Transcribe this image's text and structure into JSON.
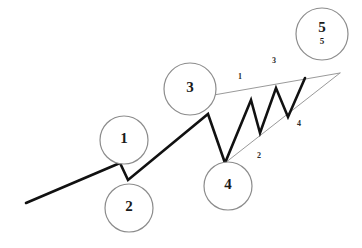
{
  "diagram": {
    "background_color": "#ffffff",
    "wave_line_color": "#111111",
    "trendline_color": "#9a9a9a",
    "circle_stroke_color": "#8c8c8c",
    "label_color": "#1a1a1a"
  },
  "wave_path": {
    "name": "main-impulse-path",
    "points": "26,203 120,163 128,180 208,114 225,163 251,100 260,133 276,88 288,117 305,78",
    "stroke_width": 2.6
  },
  "trendlines": [
    {
      "name": "upper-trendline",
      "points": "208,96 340,73",
      "stroke_width": 1.0
    },
    {
      "name": "lower-trendline",
      "points": "225,163 340,73",
      "stroke_width": 1.0
    }
  ],
  "degree_markers": [
    {
      "id": "marker-1",
      "label": "1",
      "sub_label": "",
      "cx": 124,
      "cy": 140,
      "r": 24
    },
    {
      "id": "marker-2",
      "label": "2",
      "sub_label": "",
      "cx": 129,
      "cy": 208,
      "r": 24
    },
    {
      "id": "marker-3",
      "label": "3",
      "sub_label": "",
      "cx": 190,
      "cy": 89,
      "r": 26
    },
    {
      "id": "marker-4",
      "label": "4",
      "sub_label": "",
      "cx": 228,
      "cy": 186,
      "r": 24
    },
    {
      "id": "marker-5",
      "label": "5",
      "sub_label": "5",
      "cx": 322,
      "cy": 34,
      "r": 26
    }
  ],
  "sub_wave_labels": [
    {
      "id": "sub-label-1",
      "text": "1",
      "x": 240,
      "y": 77
    },
    {
      "id": "sub-label-2",
      "text": "2",
      "x": 259,
      "y": 156
    },
    {
      "id": "sub-label-3",
      "text": "3",
      "x": 274,
      "y": 61
    },
    {
      "id": "sub-label-4",
      "text": "4",
      "x": 299,
      "y": 124
    }
  ],
  "chart_data": {
    "type": "line",
    "xlabel": "",
    "ylabel": "",
    "grid": false,
    "legend": "none",
    "xlim": [
      0,
      362
    ],
    "ylim": [
      248,
      0
    ],
    "note": "y axis is inverted screen coordinates; higher price = smaller y",
    "series": [
      {
        "name": "price",
        "kind": "polyline",
        "stroke": "#111111",
        "x": [
          26,
          120,
          128,
          208,
          225,
          251,
          260,
          276,
          288,
          305
        ],
        "y": [
          203,
          163,
          180,
          114,
          163,
          100,
          133,
          88,
          117,
          78
        ],
        "vertex_labels": [
          "start",
          "1",
          "2",
          "3",
          "4",
          "i",
          "ii",
          "iii",
          "iv",
          "v"
        ]
      },
      {
        "name": "upper-converging-trendline",
        "kind": "line",
        "stroke": "#9a9a9a",
        "x": [
          208,
          340
        ],
        "y": [
          96,
          73
        ]
      },
      {
        "name": "lower-converging-trendline",
        "kind": "line",
        "stroke": "#9a9a9a",
        "x": [
          225,
          340
        ],
        "y": [
          163,
          73
        ]
      }
    ],
    "annotations": [
      {
        "text": "1",
        "x": 124,
        "y": 140,
        "style": "circled-bold"
      },
      {
        "text": "2",
        "x": 129,
        "y": 208,
        "style": "circled-bold"
      },
      {
        "text": "3",
        "x": 190,
        "y": 89,
        "style": "circled-bold"
      },
      {
        "text": "4",
        "x": 228,
        "y": 186,
        "style": "circled-bold"
      },
      {
        "text": "5",
        "x": 322,
        "y": 34,
        "style": "circled-bold-with-subscript",
        "sub": "5"
      },
      {
        "text": "1",
        "x": 240,
        "y": 77,
        "style": "small-bold"
      },
      {
        "text": "2",
        "x": 259,
        "y": 156,
        "style": "small-bold"
      },
      {
        "text": "3",
        "x": 274,
        "y": 61,
        "style": "small-bold"
      },
      {
        "text": "4",
        "x": 299,
        "y": 124,
        "style": "small-bold"
      }
    ]
  }
}
